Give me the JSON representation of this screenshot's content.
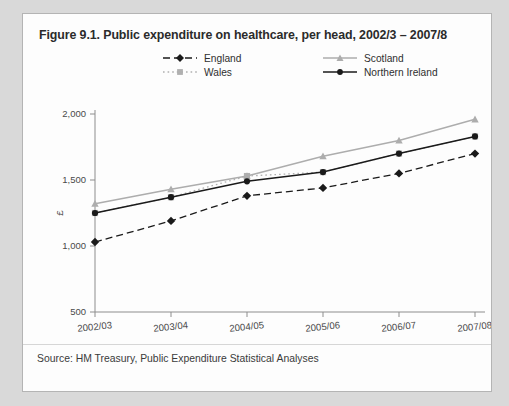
{
  "figure": {
    "title": "Figure 9.1. Public expenditure on healthcare, per head, 2002/3 – 2007/8",
    "source": "Source: HM Treasury, Public Expenditure Statistical Analyses"
  },
  "chart_data": {
    "type": "line",
    "title": "Figure 9.1. Public expenditure on healthcare, per head, 2002/3 – 2007/8",
    "xlabel": "Years",
    "ylabel": "£",
    "categories": [
      "2002/03",
      "2003/04",
      "2004/05",
      "2005/06",
      "2006/07",
      "2007/08"
    ],
    "ylim": [
      500,
      2000
    ],
    "yticks": [
      500,
      1000,
      1500,
      2000
    ],
    "ytick_labels": [
      "500",
      "1,000",
      "1,500",
      "2,000"
    ],
    "grid": false,
    "legend_position": "top",
    "series": [
      {
        "name": "England",
        "color": "#1a1a1a",
        "line_style": "dashed",
        "marker": "diamond",
        "values": [
          1030,
          1190,
          1380,
          1440,
          1550,
          1700
        ]
      },
      {
        "name": "Wales",
        "color": "#b0b0b0",
        "line_style": "dotted",
        "marker": "square",
        "values": [
          1250,
          1370,
          1530,
          1560,
          1700,
          1830
        ]
      },
      {
        "name": "Scotland",
        "color": "#adadad",
        "line_style": "solid",
        "marker": "triangle",
        "values": [
          1320,
          1430,
          1530,
          1680,
          1800,
          1960
        ]
      },
      {
        "name": "Northern Ireland",
        "color": "#1a1a1a",
        "line_style": "solid",
        "marker": "circle",
        "values": [
          1250,
          1370,
          1490,
          1560,
          1700,
          1830
        ]
      }
    ],
    "legend_order": [
      "England",
      "Scotland",
      "Wales",
      "Northern Ireland"
    ]
  }
}
